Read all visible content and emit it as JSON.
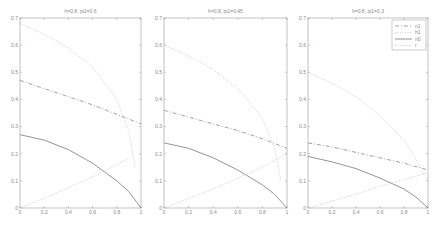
{
  "chart_data": [
    {
      "type": "line",
      "title": "h=0.8, pi1=0.6",
      "xlabel": "",
      "ylabel": "",
      "xlim": [
        0,
        1
      ],
      "ylim": [
        0,
        0.7
      ],
      "xticks": [
        "0",
        "0.2",
        "0.4",
        "0.6",
        "0.8",
        "1"
      ],
      "yticks": [
        "0",
        "0.1",
        "0.2",
        "0.3",
        "0.4",
        "0.5",
        "0.6",
        "0.7"
      ],
      "grid": false,
      "series": [
        {
          "name": "n1",
          "style": "dash-dot",
          "x": [
            0,
            0.2,
            0.4,
            0.6,
            0.8,
            1.0
          ],
          "y": [
            0.47,
            0.44,
            0.41,
            0.38,
            0.345,
            0.31
          ]
        },
        {
          "name": "h1",
          "style": "dotted",
          "x": [
            0,
            0.2,
            0.4,
            0.6,
            0.8,
            0.9,
            0.95
          ],
          "y": [
            0.68,
            0.64,
            0.59,
            0.52,
            0.4,
            0.28,
            0.15
          ]
        },
        {
          "name": "n0",
          "style": "solid",
          "x": [
            0,
            0.2,
            0.4,
            0.6,
            0.8,
            0.9,
            1.0
          ],
          "y": [
            0.27,
            0.25,
            0.215,
            0.165,
            0.1,
            0.06,
            0.0
          ]
        },
        {
          "name": "r",
          "style": "dotted",
          "x": [
            0,
            0.2,
            0.4,
            0.6,
            0.8,
            0.9
          ],
          "y": [
            0.0,
            0.035,
            0.075,
            0.115,
            0.16,
            0.185
          ]
        }
      ]
    },
    {
      "type": "line",
      "title": "h=0.8, pi1=0.45",
      "xlabel": "",
      "ylabel": "",
      "xlim": [
        0,
        1
      ],
      "ylim": [
        0,
        0.7
      ],
      "xticks": [
        "0",
        "0.2",
        "0.4",
        "0.6",
        "0.8",
        "1"
      ],
      "yticks": [
        "0",
        "0.1",
        "0.2",
        "0.3",
        "0.4",
        "0.5",
        "0.6",
        "0.7"
      ],
      "grid": false,
      "series": [
        {
          "name": "n1",
          "style": "dash-dot",
          "x": [
            0,
            0.2,
            0.4,
            0.6,
            0.8,
            1.0
          ],
          "y": [
            0.36,
            0.335,
            0.31,
            0.285,
            0.255,
            0.22
          ]
        },
        {
          "name": "h1",
          "style": "dotted",
          "x": [
            0,
            0.2,
            0.4,
            0.6,
            0.8,
            0.9,
            0.95
          ],
          "y": [
            0.6,
            0.56,
            0.51,
            0.44,
            0.33,
            0.22,
            0.1
          ]
        },
        {
          "name": "n0",
          "style": "solid",
          "x": [
            0,
            0.2,
            0.4,
            0.6,
            0.8,
            0.9,
            1.0
          ],
          "y": [
            0.24,
            0.22,
            0.185,
            0.14,
            0.085,
            0.05,
            0.0
          ]
        },
        {
          "name": "r",
          "style": "dotted",
          "x": [
            0,
            0.2,
            0.4,
            0.6,
            0.8,
            1.0
          ],
          "y": [
            0.0,
            0.035,
            0.07,
            0.11,
            0.15,
            0.2
          ]
        }
      ]
    },
    {
      "type": "line",
      "title": "h=0.8, pi1=0.3",
      "xlabel": "",
      "ylabel": "",
      "xlim": [
        0,
        1
      ],
      "ylim": [
        0,
        0.7
      ],
      "xticks": [
        "0",
        "0.2",
        "0.4",
        "0.6",
        "0.8",
        "1"
      ],
      "yticks": [
        "0",
        "0.1",
        "0.2",
        "0.3",
        "0.4",
        "0.5",
        "0.6",
        "0.7"
      ],
      "grid": false,
      "legend": {
        "position": "upper right",
        "entries": [
          "n1",
          "h1",
          "n0",
          "r"
        ]
      },
      "series": [
        {
          "name": "n1",
          "style": "dash-dot",
          "x": [
            0,
            0.2,
            0.4,
            0.6,
            0.8,
            1.0
          ],
          "y": [
            0.24,
            0.225,
            0.205,
            0.185,
            0.165,
            0.14
          ]
        },
        {
          "name": "h1",
          "style": "dotted",
          "x": [
            0,
            0.2,
            0.4,
            0.6,
            0.8,
            0.9,
            1.0
          ],
          "y": [
            0.5,
            0.46,
            0.41,
            0.34,
            0.25,
            0.18,
            0.1
          ]
        },
        {
          "name": "n0",
          "style": "solid",
          "x": [
            0,
            0.2,
            0.4,
            0.6,
            0.8,
            0.9,
            1.0
          ],
          "y": [
            0.19,
            0.17,
            0.145,
            0.11,
            0.07,
            0.04,
            0.0
          ]
        },
        {
          "name": "r",
          "style": "dotted",
          "x": [
            0,
            0.2,
            0.4,
            0.6,
            0.8,
            1.0
          ],
          "y": [
            0.0,
            0.025,
            0.05,
            0.08,
            0.105,
            0.13
          ]
        }
      ]
    }
  ],
  "panels": [
    {
      "title": "h=0.8, pi1=0.6",
      "box": {
        "x": 20,
        "y": 18,
        "w": 121,
        "h": 190
      }
    },
    {
      "title": "h=0.8, pi1=0.45",
      "box": {
        "x": 164,
        "y": 18,
        "w": 123,
        "h": 190
      }
    },
    {
      "title": "h=0.8, pi1=0.3",
      "box": {
        "x": 308,
        "y": 18,
        "w": 120,
        "h": 190
      }
    }
  ],
  "legend": {
    "entries": [
      {
        "label": "n1",
        "style": "dash-dot"
      },
      {
        "label": "h1",
        "style": "dotted"
      },
      {
        "label": "n0",
        "style": "solid"
      },
      {
        "label": "r",
        "style": "dotted"
      }
    ]
  },
  "colors": {
    "axis": "#9a9a9a",
    "line": "#7a7a7a",
    "dotted": "#b8b8b8",
    "text": "#8a8a8a"
  }
}
